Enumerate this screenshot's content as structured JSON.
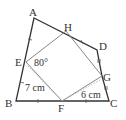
{
  "diagram": {
    "type": "geometry-pentagon-with-inscribed-quadrilateral",
    "points": {
      "A": {
        "label": "A",
        "x": 34,
        "y": 18
      },
      "H": {
        "label": "H",
        "x": 66,
        "y": 31
      },
      "D": {
        "label": "D",
        "x": 97,
        "y": 50
      },
      "G": {
        "label": "G",
        "x": 102,
        "y": 76
      },
      "C": {
        "label": "C",
        "x": 109,
        "y": 101
      },
      "F": {
        "label": "F",
        "x": 62,
        "y": 101
      },
      "B": {
        "label": "B",
        "x": 16,
        "y": 101
      },
      "E": {
        "label": "E",
        "x": 26,
        "y": 62
      }
    },
    "annotations": {
      "angle_E": "80°",
      "length_EF": "7 cm",
      "length_FG": "6 cm"
    },
    "colors": {
      "outline": "#333333",
      "inner": "#777777",
      "dotted": "#999999"
    }
  }
}
